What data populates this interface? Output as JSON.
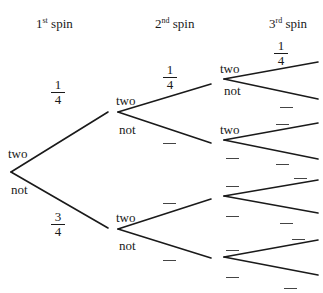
{
  "headers": {
    "spin1": {
      "num": "1",
      "sup": "st",
      "word": "spin"
    },
    "spin2": {
      "num": "2",
      "sup": "nd",
      "word": "spin"
    },
    "spin3": {
      "num": "3",
      "sup": "rd",
      "word": "spin"
    }
  },
  "level1": {
    "two_label": "two",
    "not_label": "not",
    "two_prob": {
      "num": "1",
      "den": "4"
    },
    "not_prob": {
      "num": "3",
      "den": "4"
    }
  },
  "level2": {
    "upper": {
      "two_label": "two",
      "not_label": "not",
      "two_prob": {
        "num": "1",
        "den": "4"
      },
      "not_prob": ""
    },
    "lower": {
      "two_label": "two",
      "not_label": "not",
      "two_prob": "",
      "not_prob": ""
    }
  },
  "level3": {
    "node1": {
      "two_label": "two",
      "not_label": "not",
      "two_prob": {
        "num": "1",
        "den": "4"
      },
      "not_prob": ""
    },
    "node2": {
      "two_label": "two",
      "not_label": "",
      "two_prob": "",
      "not_prob": ""
    },
    "node3": {
      "two_label": "",
      "not_label": "",
      "two_prob": "",
      "not_prob": ""
    },
    "node4": {
      "two_label": "",
      "not_label": "",
      "two_prob": "",
      "not_prob": ""
    }
  },
  "colors": {
    "line": "#1a1a1a",
    "blank": "#444444",
    "background": "#ffffff"
  }
}
